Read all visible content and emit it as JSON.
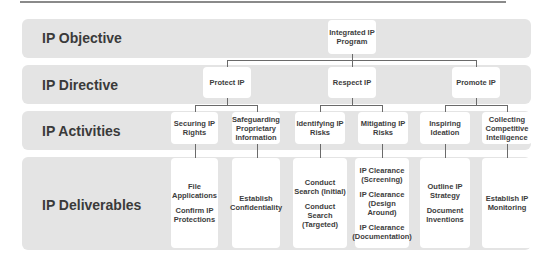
{
  "levels": [
    {
      "label": "IP Objective"
    },
    {
      "label": "IP Directive"
    },
    {
      "label": "IP Activities"
    },
    {
      "label": "IP Deliverables"
    }
  ],
  "objective": {
    "label": "Integrated IP Program"
  },
  "directives": [
    {
      "label": "Protect IP"
    },
    {
      "label": "Respect IP"
    },
    {
      "label": "Promote IP"
    }
  ],
  "activities": [
    {
      "label": "Securing IP Rights"
    },
    {
      "label": "Safeguarding Proprietary Information"
    },
    {
      "label": "Identifying IP Risks"
    },
    {
      "label": "Mitigating IP Risks"
    },
    {
      "label": "Inspiring Ideation"
    },
    {
      "label": "Collecting Competitive Intelligence"
    }
  ],
  "deliverables": [
    {
      "items": [
        "File Applications",
        "Confirm IP Protections"
      ]
    },
    {
      "items": [
        "Establish Confidentiality"
      ]
    },
    {
      "items": [
        "Conduct Search (Initial)",
        "Conduct Search (Targeted)"
      ]
    },
    {
      "items": [
        "IP Clearance (Screening)",
        "IP Clearance (Design Around)",
        "IP Clearance (Documentation)"
      ]
    },
    {
      "items": [
        "Outline IP Strategy",
        "Document Inventions"
      ]
    },
    {
      "items": [
        "Establish IP Monitoring"
      ]
    }
  ],
  "colors": {
    "band": "#e4e4e4",
    "box": "#ffffff",
    "line": "#6a6a6a",
    "label": "#3a3a3a"
  }
}
